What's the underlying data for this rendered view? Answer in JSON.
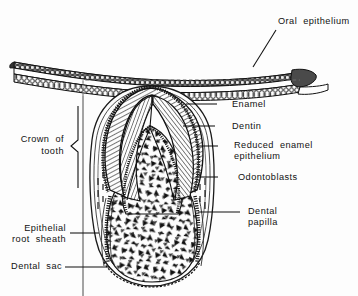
{
  "figure": {
    "background_color": "#fdfdfd",
    "ink_color": "#111111"
  },
  "labels": {
    "oral_epithelium": "Oral  epithelium",
    "enamel": "Enamel",
    "dentin": "Dentin",
    "reduced_enamel_epithelium_line1": "Reduced  enamel",
    "reduced_enamel_epithelium_line2": "epithelium",
    "odontoblasts": "Odontoblasts",
    "dental_papilla_line1": "Dental",
    "dental_papilla_line2": "papilla",
    "crown_of_tooth_line1": "Crown  of",
    "crown_of_tooth_line2": "tooth",
    "epithelial_root_sheath_line1": "Epithelial",
    "epithelial_root_sheath_line2": "root  sheath",
    "dental_sac": "Dental  sac"
  },
  "structures": [
    {
      "name": "oral-epithelium",
      "description": "stratified cellular band arching across the top of the figure"
    },
    {
      "name": "enamel",
      "description": "outer hatched cap layer of the crown"
    },
    {
      "name": "dentin",
      "description": "inner hatched layer beneath enamel"
    },
    {
      "name": "reduced-enamel-epithelium",
      "description": "thin beaded layer covering the enamel surface"
    },
    {
      "name": "odontoblasts",
      "description": "columnar cell row lining the papilla border"
    },
    {
      "name": "dental-papilla",
      "description": "stippled triangular-textured core of the tooth germ"
    },
    {
      "name": "epithelial-root-sheath",
      "description": "beaded epithelial strand descending along the root region"
    },
    {
      "name": "dental-sac",
      "description": "outer follicular envelope surrounding the tooth germ"
    },
    {
      "name": "crown-of-tooth",
      "description": "brace marking the crown extent on the left"
    }
  ]
}
